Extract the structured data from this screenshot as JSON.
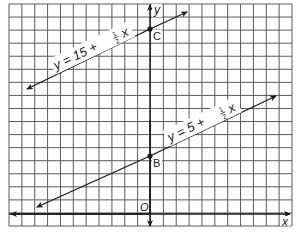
{
  "diagram": {
    "type": "coordinate-plane",
    "grid": {
      "columns": 22,
      "rows": 17,
      "line_color": "#555555",
      "background": "#ffffff"
    },
    "axes": {
      "x_label": "x",
      "y_label": "y",
      "origin_label": "O"
    },
    "lines": [
      {
        "equation_prefix": "y = 15 + ",
        "fraction_num": "1",
        "fraction_den": "2",
        "equation_suffix": "x",
        "y_intercept": 15,
        "slope": "1/2"
      },
      {
        "equation_prefix": "y = 5 + ",
        "fraction_num": "1",
        "fraction_den": "2",
        "equation_suffix": "x",
        "y_intercept": 5,
        "slope": "1/2"
      }
    ],
    "points": [
      {
        "label": "C",
        "on_line": "y = 15 + 1/2 x"
      },
      {
        "label": "B",
        "on_line": "y = 5 + 1/2 x"
      }
    ]
  }
}
